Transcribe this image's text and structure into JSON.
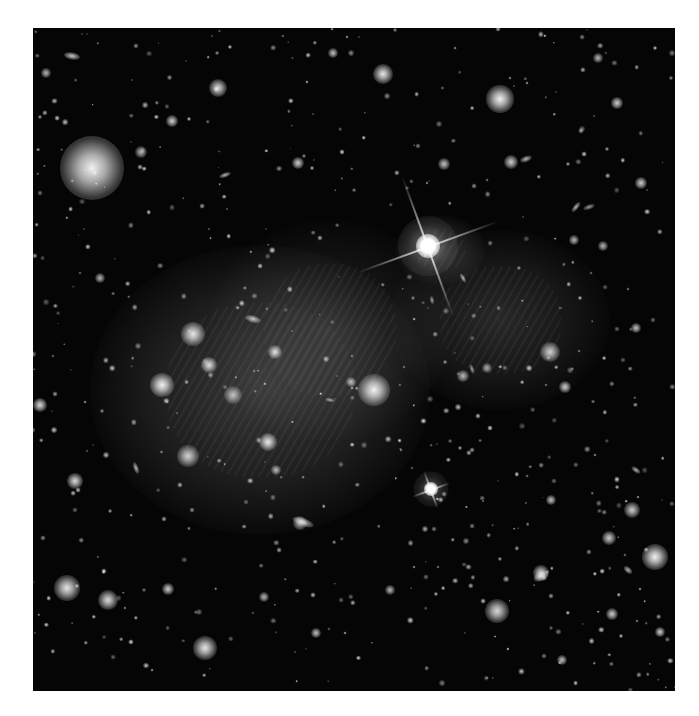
{
  "image": {
    "description": "Grayscale deep-field astronomical image of a galaxy cluster with diffuse intracluster glow, bright foreground stars with diffraction spikes, and many background galaxies",
    "frame": {
      "x": 33,
      "y": 28,
      "width": 642,
      "height": 663
    },
    "background_color": "#050505",
    "diffuse_glows": [
      {
        "x": 260,
        "y": 390,
        "rx": 170,
        "ry": 145,
        "opacity": 0.26
      },
      {
        "x": 330,
        "y": 330,
        "rx": 120,
        "ry": 110,
        "opacity": 0.14
      },
      {
        "x": 500,
        "y": 320,
        "rx": 110,
        "ry": 90,
        "opacity": 0.18
      },
      {
        "x": 440,
        "y": 250,
        "rx": 45,
        "ry": 35,
        "opacity": 0.2
      }
    ],
    "spiked_stars": [
      {
        "x": 428,
        "y": 246,
        "r": 12,
        "spike_len": 150
      },
      {
        "x": 431,
        "y": 489,
        "r": 7,
        "spike_len": 40
      }
    ],
    "bright_objects": [
      {
        "x": 92,
        "y": 168,
        "r": 32,
        "b": 0.95
      },
      {
        "x": 500,
        "y": 99,
        "r": 14,
        "b": 0.95
      },
      {
        "x": 383,
        "y": 74,
        "r": 10,
        "b": 0.9
      },
      {
        "x": 218,
        "y": 88,
        "r": 9,
        "b": 0.85
      },
      {
        "x": 374,
        "y": 390,
        "r": 16,
        "b": 0.95
      },
      {
        "x": 193,
        "y": 334,
        "r": 12,
        "b": 0.9
      },
      {
        "x": 162,
        "y": 385,
        "r": 12,
        "b": 0.95
      },
      {
        "x": 209,
        "y": 365,
        "r": 8,
        "b": 0.85
      },
      {
        "x": 268,
        "y": 442,
        "r": 9,
        "b": 0.9
      },
      {
        "x": 188,
        "y": 456,
        "r": 11,
        "b": 0.8
      },
      {
        "x": 233,
        "y": 395,
        "r": 9,
        "b": 0.7
      },
      {
        "x": 275,
        "y": 352,
        "r": 7,
        "b": 0.85
      },
      {
        "x": 550,
        "y": 352,
        "r": 10,
        "b": 0.8
      },
      {
        "x": 655,
        "y": 557,
        "r": 13,
        "b": 0.95
      },
      {
        "x": 497,
        "y": 611,
        "r": 12,
        "b": 0.85
      },
      {
        "x": 67,
        "y": 588,
        "r": 13,
        "b": 0.9
      },
      {
        "x": 108,
        "y": 600,
        "r": 10,
        "b": 0.85
      },
      {
        "x": 205,
        "y": 648,
        "r": 12,
        "b": 0.9
      },
      {
        "x": 541,
        "y": 573,
        "r": 8,
        "b": 0.85
      },
      {
        "x": 609,
        "y": 538,
        "r": 7,
        "b": 0.8
      },
      {
        "x": 632,
        "y": 510,
        "r": 8,
        "b": 0.8
      },
      {
        "x": 75,
        "y": 481,
        "r": 8,
        "b": 0.85
      },
      {
        "x": 141,
        "y": 152,
        "r": 6,
        "b": 0.7
      },
      {
        "x": 298,
        "y": 163,
        "r": 6,
        "b": 0.8
      },
      {
        "x": 444,
        "y": 164,
        "r": 6,
        "b": 0.75
      },
      {
        "x": 511,
        "y": 162,
        "r": 7,
        "b": 0.8
      },
      {
        "x": 641,
        "y": 183,
        "r": 6,
        "b": 0.8
      },
      {
        "x": 617,
        "y": 103,
        "r": 6,
        "b": 0.8
      },
      {
        "x": 172,
        "y": 121,
        "r": 6,
        "b": 0.8
      },
      {
        "x": 300,
        "y": 523,
        "r": 7,
        "b": 0.7
      },
      {
        "x": 40,
        "y": 405,
        "r": 7,
        "b": 0.85
      },
      {
        "x": 565,
        "y": 387,
        "r": 6,
        "b": 0.8
      },
      {
        "x": 636,
        "y": 328,
        "r": 5,
        "b": 0.75
      },
      {
        "x": 463,
        "y": 376,
        "r": 6,
        "b": 0.7
      },
      {
        "x": 487,
        "y": 368,
        "r": 5,
        "b": 0.65
      },
      {
        "x": 351,
        "y": 382,
        "r": 5,
        "b": 0.7
      },
      {
        "x": 276,
        "y": 470,
        "r": 5,
        "b": 0.7
      },
      {
        "x": 574,
        "y": 240,
        "r": 5,
        "b": 0.7
      },
      {
        "x": 603,
        "y": 246,
        "r": 5,
        "b": 0.7
      },
      {
        "x": 660,
        "y": 632,
        "r": 5,
        "b": 0.8
      },
      {
        "x": 562,
        "y": 660,
        "r": 5,
        "b": 0.75
      },
      {
        "x": 316,
        "y": 633,
        "r": 5,
        "b": 0.75
      },
      {
        "x": 390,
        "y": 590,
        "r": 5,
        "b": 0.7
      },
      {
        "x": 168,
        "y": 589,
        "r": 6,
        "b": 0.8
      },
      {
        "x": 264,
        "y": 597,
        "r": 5,
        "b": 0.7
      },
      {
        "x": 333,
        "y": 53,
        "r": 5,
        "b": 0.75
      },
      {
        "x": 46,
        "y": 73,
        "r": 5,
        "b": 0.7
      },
      {
        "x": 598,
        "y": 58,
        "r": 5,
        "b": 0.7
      },
      {
        "x": 551,
        "y": 500,
        "r": 5,
        "b": 0.75
      },
      {
        "x": 612,
        "y": 614,
        "r": 6,
        "b": 0.8
      },
      {
        "x": 100,
        "y": 278,
        "r": 5,
        "b": 0.7
      }
    ],
    "elongated_galaxies": [
      {
        "x": 72,
        "y": 56,
        "w": 16,
        "h": 7,
        "angle": 10,
        "b": 0.8
      },
      {
        "x": 225,
        "y": 175,
        "w": 12,
        "h": 5,
        "angle": -20,
        "b": 0.7
      },
      {
        "x": 253,
        "y": 319,
        "w": 16,
        "h": 7,
        "angle": 15,
        "b": 0.75
      },
      {
        "x": 303,
        "y": 522,
        "w": 22,
        "h": 8,
        "angle": 20,
        "b": 0.75
      },
      {
        "x": 136,
        "y": 468,
        "w": 12,
        "h": 5,
        "angle": 70,
        "b": 0.7
      },
      {
        "x": 541,
        "y": 576,
        "w": 16,
        "h": 9,
        "angle": -30,
        "b": 0.75
      },
      {
        "x": 576,
        "y": 207,
        "w": 12,
        "h": 5,
        "angle": -50,
        "b": 0.7
      },
      {
        "x": 463,
        "y": 278,
        "w": 10,
        "h": 4,
        "angle": 60,
        "b": 0.7
      },
      {
        "x": 636,
        "y": 470,
        "w": 10,
        "h": 5,
        "angle": 35,
        "b": 0.7
      },
      {
        "x": 589,
        "y": 207,
        "w": 12,
        "h": 5,
        "angle": -20,
        "b": 0.6
      },
      {
        "x": 432,
        "y": 300,
        "w": 8,
        "h": 4,
        "angle": 80,
        "b": 0.6
      },
      {
        "x": 472,
        "y": 369,
        "w": 10,
        "h": 4,
        "angle": 70,
        "b": 0.6
      },
      {
        "x": 526,
        "y": 159,
        "w": 12,
        "h": 6,
        "angle": -20,
        "b": 0.7
      },
      {
        "x": 628,
        "y": 570,
        "w": 10,
        "h": 6,
        "angle": 40,
        "b": 0.7
      },
      {
        "x": 330,
        "y": 400,
        "w": 10,
        "h": 4,
        "angle": 10,
        "b": 0.6
      }
    ],
    "faint_point_sources_seed": 7,
    "faint_point_sources_count": 520
  }
}
